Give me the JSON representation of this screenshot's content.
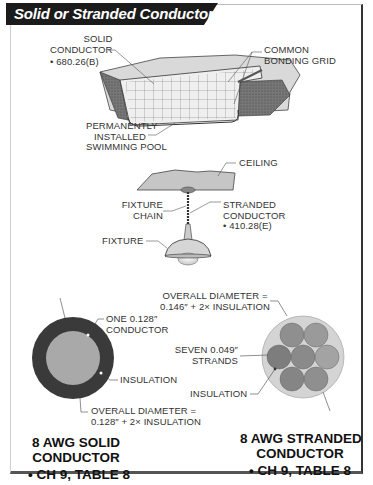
{
  "title": "Solid or Stranded Conductors",
  "pool_section": {
    "solid_conductor": {
      "line1": "SOLID",
      "line2": "CONDUCTOR",
      "ref": "• 680.26(B)"
    },
    "bonding_grid": {
      "line1": "COMMON",
      "line2": "BONDING GRID"
    },
    "pool": {
      "line1": "PERMANENTLY",
      "line2": "INSTALLED",
      "line3": "SWIMMING POOL"
    }
  },
  "fixture_section": {
    "ceiling": "CEILING",
    "fixture_chain": {
      "line1": "FIXTURE",
      "line2": "CHAIN"
    },
    "stranded_conductor": {
      "line1": "STRANDED",
      "line2": "CONDUCTOR",
      "ref": "• 410.28(E)"
    },
    "fixture": "FIXTURE"
  },
  "solid_wire": {
    "conductor": {
      "line1": "ONE 0.128″",
      "line2": "CONDUCTOR"
    },
    "insulation": "INSULATION",
    "diameter": {
      "line1": "OVERALL DIAMETER =",
      "line2": "0.128″ + 2× INSULATION"
    },
    "caption": {
      "line1": "8 AWG SOLID",
      "line2": "CONDUCTOR",
      "ref": "• CH 9, TABLE 8"
    },
    "colors": {
      "insulation": "#3a3a3a",
      "conductor": "#a9a9a9"
    }
  },
  "stranded_wire": {
    "diameter": {
      "line1": "OVERALL DIAMETER =",
      "line2": "0.146″ + 2× INSULATION"
    },
    "strands": {
      "line1": "SEVEN 0.049″",
      "line2": "STRANDS"
    },
    "insulation": "INSULATION",
    "caption": {
      "line1": "8 AWG STRANDED",
      "line2": "CONDUCTOR",
      "ref": "• CH 9, TABLE 8"
    },
    "colors": {
      "insulation": "#d4d4d4",
      "strand": "#8f8f8f"
    }
  }
}
